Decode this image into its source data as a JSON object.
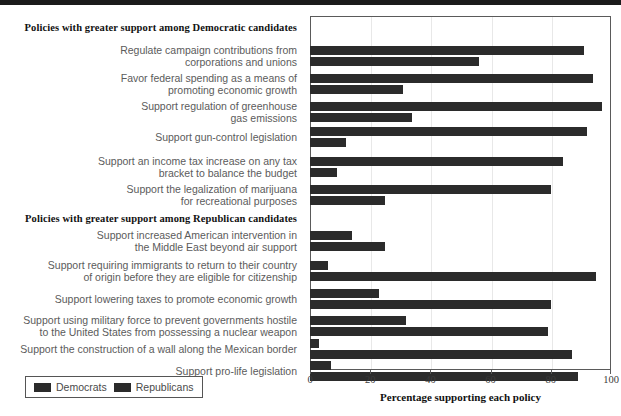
{
  "chart_data": {
    "type": "bar",
    "title": "",
    "xlabel": "Percentage supporting each policy",
    "ylabel": "",
    "xlim": [
      0,
      100
    ],
    "xticks": [
      0,
      20,
      40,
      60,
      80,
      100
    ],
    "grid": true,
    "orientation": "horizontal",
    "legend": {
      "position": "bottom-left",
      "entries": [
        {
          "name": "Democrats",
          "color": "#2b2b2b"
        },
        {
          "name": "Republicans",
          "color": "#2b2b2b"
        }
      ]
    },
    "sections": [
      {
        "heading": "Policies with greater support among Democratic candidates",
        "categories": [
          "Regulate campaign contributions from\ncorporations and unions",
          "Favor federal spending as a means of\npromoting economic growth",
          "Support regulation of greenhouse\ngas emissions",
          "Support gun-control legislation",
          "Support an income tax increase on any tax\nbracket to balance the budget",
          "Support the legalization of marijuana\nfor recreational purposes"
        ],
        "series": [
          {
            "name": "Democrats",
            "values": [
              91,
              94,
              97,
              92,
              84,
              80
            ]
          },
          {
            "name": "Republicans",
            "values": [
              56,
              31,
              34,
              12,
              9,
              25
            ]
          }
        ]
      },
      {
        "heading": "Policies with greater support among Republican candidates",
        "categories": [
          "Support increased American intervention in\nthe Middle East beyond air support",
          "Support requiring immigrants to return to their country\nof origin before they are eligible for citizenship",
          "Support lowering taxes to promote economic growth",
          "Support using military force to prevent governments hostile\nto the United States from possessing a nuclear weapon",
          "Support the construction of a wall along the Mexican border",
          "Support pro-life legislation"
        ],
        "series": [
          {
            "name": "Democrats",
            "values": [
              14,
              6,
              23,
              32,
              3,
              7
            ]
          },
          {
            "name": "Republicans",
            "values": [
              25,
              95,
              80,
              79,
              87,
              89
            ]
          }
        ]
      }
    ]
  },
  "axis": {
    "tick_labels": [
      "0",
      "20",
      "40",
      "60",
      "80",
      "100"
    ],
    "xlabel": "Percentage supporting each policy"
  },
  "legend": {
    "democrats_label": "Democrats",
    "republicans_label": "Republicans"
  },
  "sections": {
    "democratic_heading": "Policies with greater support among Democratic candidates",
    "republican_heading": "Policies with greater support among Republican candidates"
  },
  "labels": {
    "d0": "Regulate campaign contributions from\ncorporations and unions",
    "d1": "Favor federal spending as a means of\npromoting economic growth",
    "d2": "Support regulation of greenhouse\ngas emissions",
    "d3": "Support gun-control legislation",
    "d4": "Support an income tax increase on any tax\nbracket to balance the budget",
    "d5": "Support the legalization of marijuana\nfor recreational purposes",
    "r0": "Support increased American intervention in\nthe Middle East beyond air support",
    "r1": "Support requiring immigrants to return to their country\nof origin before they are eligible for citizenship",
    "r2": "Support lowering taxes to promote economic growth",
    "r3": "Support using military force to prevent governments hostile\nto the United States from possessing a nuclear weapon",
    "r4": "Support the construction of a wall along the Mexican border",
    "r5": "Support pro-life legislation"
  }
}
